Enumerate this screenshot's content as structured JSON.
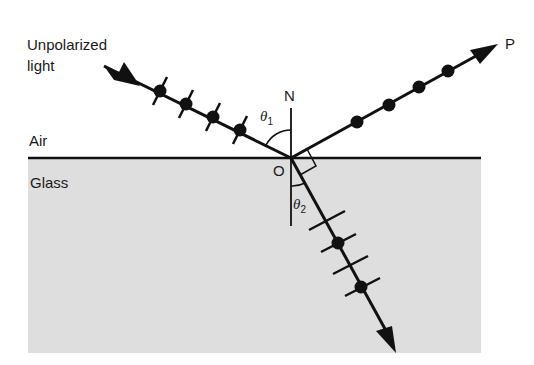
{
  "labels": {
    "source_line1": "Unpolarized",
    "source_line2": "light",
    "medium_top": "Air",
    "medium_bottom": "Glass",
    "normal": "N",
    "origin": "O",
    "reflected_end": "P",
    "theta1_symbol": "θ",
    "theta1_sub": "1",
    "theta2_symbol": "θ",
    "theta2_sub": "2"
  },
  "colors": {
    "ink": "#111111",
    "glass": "#dedede",
    "background": "#ffffff"
  },
  "geometry": {
    "origin": [
      291,
      158
    ],
    "incident_start": [
      104,
      66
    ],
    "reflected_tip": [
      497,
      44
    ],
    "refracted_tip": [
      396,
      353
    ],
    "normal_top": 108,
    "normal_bottom": 225
  }
}
